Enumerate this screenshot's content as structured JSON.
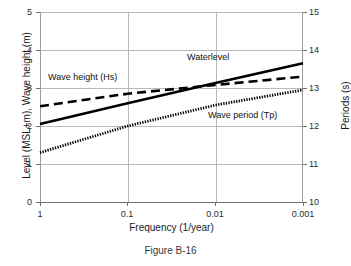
{
  "figure": {
    "caption": "Figure B-16"
  },
  "chart_data": {
    "type": "line",
    "title": "",
    "xlabel": "Frequency (1/year)",
    "ylabel": "Level (MSL+m), Wave height (m)",
    "y2label": "Periods (s)",
    "xscale": "log",
    "x_reversed": true,
    "xlim": [
      1,
      0.001
    ],
    "ylim": [
      0,
      5
    ],
    "y2lim": [
      10,
      15
    ],
    "xticks": [
      "1",
      "0.1",
      "0.01",
      "0.001"
    ],
    "xtick_values": [
      1,
      0.1,
      0.01,
      0.001
    ],
    "yticks": [
      "0",
      "1",
      "2",
      "3",
      "4",
      "5"
    ],
    "ytick_values": [
      0,
      1,
      2,
      3,
      4,
      5
    ],
    "y2ticks": [
      "10",
      "11",
      "12",
      "13",
      "14",
      "15"
    ],
    "y2tick_values": [
      10,
      11,
      12,
      13,
      14,
      15
    ],
    "grid": true,
    "legend_position": "inline-annotations",
    "x": [
      1,
      0.1,
      0.01,
      0.001
    ],
    "series": [
      {
        "name": "Waterlevel",
        "style": "solid",
        "axis": "left",
        "values": [
          2.05,
          2.6,
          3.13,
          3.65
        ],
        "annotation": "Waterlevel"
      },
      {
        "name": "Wave height (Hs)",
        "style": "dashed",
        "axis": "left",
        "values": [
          2.52,
          2.85,
          3.08,
          3.3
        ],
        "annotation": "Wave height (Hs)"
      },
      {
        "name": "Wave period (Tp)",
        "style": "dotted",
        "axis": "right",
        "values": [
          11.3,
          12.0,
          12.55,
          12.95
        ],
        "values_left_scale": [
          1.3,
          2.0,
          2.55,
          2.95
        ],
        "annotation": "Wave period (Tp)"
      }
    ],
    "colors": {
      "line": "#000000",
      "grid": "#b9b9b9",
      "axis": "#6f6f6f",
      "text": "#1a1a1a",
      "background": "#ffffff"
    }
  }
}
